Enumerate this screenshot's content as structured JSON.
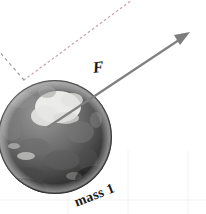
{
  "figure": {
    "background_color": "#ffffff"
  },
  "labels": {
    "force": "F",
    "mass": "mass 1"
  },
  "colors": {
    "arrow": "#808080",
    "arrow_dark": "#6e6e6e",
    "dotted_guide": "#c8a8ac",
    "dashed_guide": "#9a9a9a",
    "gridline": "#f2f2f2",
    "label_text": "#1a1a1a"
  },
  "geometry": {
    "sphere": {
      "center_x": 55,
      "center_y": 137,
      "radius": 57
    },
    "force_vector": {
      "tail_x": 48,
      "tail_y": 127,
      "tip_x": 189,
      "tip_y": 33,
      "head_length": 14,
      "head_width": 9,
      "stroke_width": 2.2
    },
    "dotted_guide": {
      "start_x": 24,
      "start_y": 80,
      "end_x": 132,
      "end_y": 0
    },
    "dashed_guide": {
      "start_x": 24,
      "start_y": 80,
      "end_x": -2,
      "end_y": 50
    },
    "gridlines_vertical": [
      68,
      128,
      188
    ],
    "gridline_horizontal": 200
  }
}
